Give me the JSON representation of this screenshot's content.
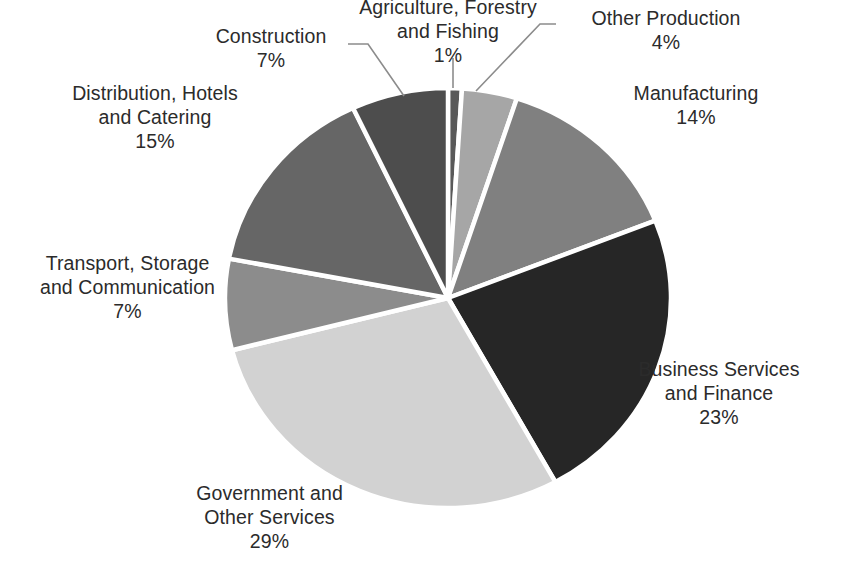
{
  "chart_data": {
    "type": "pie",
    "title": "",
    "subtitle": "",
    "xlabel": "",
    "ylabel": "",
    "legend_position": "none",
    "grid": false,
    "start_angle_deg": 0,
    "direction": "clockwise",
    "unit": "%",
    "categories": [
      "Agriculture, Forestry and Fishing",
      "Other Production",
      "Manufacturing",
      "Business Services and Finance",
      "Government and Other Services",
      "Transport, Storage and Communication",
      "Distribution, Hotels and Catering",
      "Construction"
    ],
    "values": [
      1,
      4,
      14,
      23,
      29,
      7,
      15,
      7
    ],
    "colors": [
      "#595959",
      "#a6a6a6",
      "#808080",
      "#262626",
      "#d2d2d2",
      "#8c8c8c",
      "#666666",
      "#4d4d4d"
    ],
    "slices": [
      {
        "name": "Agriculture, Forestry and Fishing",
        "value": 1,
        "label": "1%",
        "color": "#595959"
      },
      {
        "name": "Other Production",
        "value": 4,
        "label": "4%",
        "color": "#a6a6a6"
      },
      {
        "name": "Manufacturing",
        "value": 14,
        "label": "14%",
        "color": "#808080"
      },
      {
        "name": "Business Services and Finance",
        "value": 23,
        "label": "23%",
        "color": "#262626"
      },
      {
        "name": "Government and Other Services",
        "value": 29,
        "label": "29%",
        "color": "#d2d2d2"
      },
      {
        "name": "Transport, Storage and Communication",
        "value": 7,
        "label": "7%",
        "color": "#8c8c8c"
      },
      {
        "name": "Distribution, Hotels and Catering",
        "value": 15,
        "label": "15%",
        "color": "#666666"
      },
      {
        "name": "Construction",
        "value": 7,
        "label": "7%",
        "color": "#4d4d4d"
      }
    ]
  },
  "labels": {
    "agriculture": {
      "line1": "Agriculture, Forestry",
      "line2": "and Fishing",
      "value": "1%"
    },
    "other_production": {
      "line1": "Other Production",
      "line2": "",
      "value": "4%"
    },
    "manufacturing": {
      "line1": "Manufacturing",
      "line2": "",
      "value": "14%"
    },
    "business": {
      "line1": "Business Services",
      "line2": "and Finance",
      "value": "23%"
    },
    "government": {
      "line1": "Government and",
      "line2": "Other Services",
      "value": "29%"
    },
    "transport": {
      "line1": "Transport, Storage",
      "line2": "and Communication",
      "value": "7%"
    },
    "distribution": {
      "line1": "Distribution, Hotels",
      "line2": "and Catering",
      "value": "15%"
    },
    "construction": {
      "line1": "Construction",
      "line2": "",
      "value": "7%"
    }
  },
  "style": {
    "background": "#ffffff",
    "text_color": "#2b2b2b",
    "slice_gap_color": "#ffffff",
    "leader_line_color": "#808080"
  }
}
